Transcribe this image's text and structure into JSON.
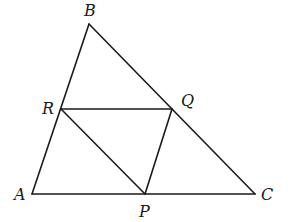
{
  "diagram": {
    "type": "geometry",
    "points": {
      "A": {
        "label": "A",
        "x": 32,
        "y": 194,
        "label_x": 14,
        "label_y": 200
      },
      "B": {
        "label": "B",
        "x": 89,
        "y": 24,
        "label_x": 84,
        "label_y": 16
      },
      "C": {
        "label": "C",
        "x": 255,
        "y": 194,
        "label_x": 261,
        "label_y": 200
      },
      "R": {
        "label": "R",
        "x": 61,
        "y": 109,
        "label_x": 42,
        "label_y": 114
      },
      "Q": {
        "label": "Q",
        "x": 172,
        "y": 109,
        "label_x": 181,
        "label_y": 106
      },
      "P": {
        "label": "P",
        "x": 145,
        "y": 194,
        "label_x": 139,
        "label_y": 217
      }
    },
    "segments": [
      {
        "name": "AB",
        "from": "A",
        "to": "B"
      },
      {
        "name": "BC",
        "from": "B",
        "to": "C"
      },
      {
        "name": "CA",
        "from": "C",
        "to": "A"
      },
      {
        "name": "RQ",
        "from": "R",
        "to": "Q"
      },
      {
        "name": "RP",
        "from": "R",
        "to": "P"
      },
      {
        "name": "PQ",
        "from": "P",
        "to": "Q"
      }
    ],
    "colors": {
      "stroke": "#1a1a1a",
      "background": "#ffffff"
    }
  }
}
